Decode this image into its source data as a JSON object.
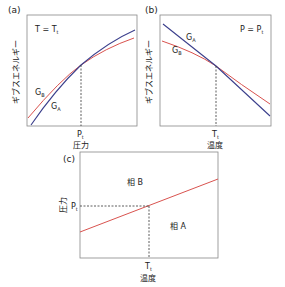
{
  "colors": {
    "phase_a": "#3b3f8c",
    "phase_b": "#d9534f",
    "frame": "#888888",
    "dash": "#333333"
  },
  "panel_a": {
    "label": "(a)",
    "condition": "T = T",
    "condition_sub": "t",
    "ylabel": "ギブスエネルギー",
    "xtick": "P",
    "xtick_sub": "t",
    "xlabel": "圧力",
    "curve_b": "G",
    "curve_b_sub": "B",
    "curve_a": "G",
    "curve_a_sub": "A"
  },
  "panel_b": {
    "label": "(b)",
    "condition": "P = P",
    "condition_sub": "t",
    "ylabel": "ギブスエネルギー",
    "xtick": "T",
    "xtick_sub": "t",
    "xlabel": "温度",
    "curve_a": "G",
    "curve_a_sub": "A",
    "curve_b": "G",
    "curve_b_sub": "B"
  },
  "panel_c": {
    "label": "(c)",
    "ylabel": "圧力",
    "ytick": "P",
    "ytick_sub": "t",
    "xtick": "T",
    "xtick_sub": "t",
    "xlabel": "温度",
    "region_upper": "相 B",
    "region_lower": "相 A"
  }
}
